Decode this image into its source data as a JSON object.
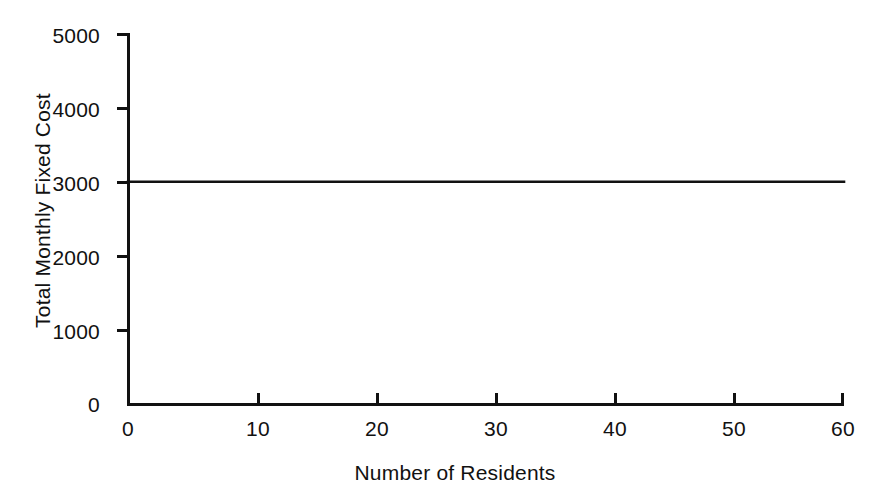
{
  "chart_data": {
    "type": "line",
    "title": "",
    "subtitle": "",
    "xlabel": "Number of Residents",
    "ylabel": "Total Monthly Fixed Cost",
    "xlim": [
      0,
      60
    ],
    "ylim": [
      0,
      5000
    ],
    "grid": false,
    "legend": null,
    "x_ticks": [
      {
        "value": 0,
        "label": "0"
      },
      {
        "value": 10,
        "label": "10"
      },
      {
        "value": 20,
        "label": "20"
      },
      {
        "value": 30,
        "label": "30"
      },
      {
        "value": 40,
        "label": "40"
      },
      {
        "value": 50,
        "label": "50"
      },
      {
        "value": 60,
        "label": "60"
      }
    ],
    "y_ticks": [
      {
        "value": 0,
        "label": "0"
      },
      {
        "value": 1000,
        "label": "1000"
      },
      {
        "value": 2000,
        "label": "2000"
      },
      {
        "value": 3000,
        "label": "3000"
      },
      {
        "value": 4000,
        "label": "4000"
      },
      {
        "value": 5000,
        "label": "5000"
      }
    ],
    "series": [
      {
        "name": "Total Monthly Fixed Cost",
        "color": "#111111",
        "x": [
          0,
          10,
          20,
          30,
          40,
          50,
          60
        ],
        "values": [
          3000,
          3000,
          3000,
          3000,
          3000,
          3000,
          3000
        ]
      }
    ]
  },
  "chart_style": {
    "line_color": "#111111",
    "axis_color": "#111111",
    "background": "#ffffff"
  }
}
